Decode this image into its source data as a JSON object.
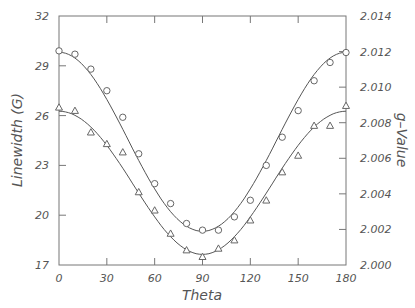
{
  "chart_data": {
    "type": "scatter",
    "title": "",
    "xlabel": "Theta",
    "ylabel": "Linewidth (G)",
    "y2label": "g–Value",
    "xlim": [
      0,
      180
    ],
    "ylim": [
      17,
      32
    ],
    "y2lim": [
      2.0,
      2.014
    ],
    "x_ticks": [
      0,
      30,
      60,
      90,
      120,
      150,
      180
    ],
    "x_tick_labels": [
      "0",
      "30",
      "60",
      "90",
      "120",
      "150",
      "180"
    ],
    "y_ticks": [
      17,
      20,
      23,
      26,
      29,
      32
    ],
    "y_tick_labels": [
      "17",
      "20",
      "23",
      "26",
      "29",
      "32"
    ],
    "y2_ticks": [
      2.0,
      2.002,
      2.004,
      2.006,
      2.008,
      2.01,
      2.012,
      2.014
    ],
    "y2_tick_labels": [
      "2.000",
      "2.002",
      "2.004",
      "2.006",
      "2.008",
      "2.010",
      "2.012",
      "2.014"
    ],
    "grid": false,
    "legend": null,
    "x": [
      0,
      10,
      20,
      30,
      40,
      50,
      60,
      70,
      80,
      90,
      100,
      110,
      120,
      130,
      140,
      150,
      160,
      170,
      180
    ],
    "series": [
      {
        "name": "Linewidth (circles)",
        "marker": "circle",
        "axis": "left",
        "values": [
          29.9,
          29.7,
          28.8,
          27.5,
          25.9,
          23.7,
          21.9,
          20.7,
          19.5,
          19.1,
          19.1,
          19.9,
          20.9,
          23.0,
          24.7,
          26.3,
          28.1,
          29.2,
          29.8
        ]
      },
      {
        "name": "g-Value (triangles)",
        "marker": "triangle",
        "axis": "right",
        "values_left_scale": [
          26.5,
          26.3,
          25.0,
          24.3,
          23.8,
          21.4,
          20.3,
          18.9,
          17.9,
          17.5,
          18.0,
          18.5,
          19.7,
          20.9,
          22.6,
          23.6,
          25.4,
          25.4,
          26.6
        ],
        "values": [
          2.0088,
          2.0087,
          2.0075,
          2.0068,
          2.0064,
          2.0041,
          2.0031,
          2.0018,
          2.0008,
          2.0005,
          2.0009,
          2.0014,
          2.0025,
          2.0036,
          2.0052,
          2.0061,
          2.0078,
          2.0078,
          2.0089
        ]
      }
    ],
    "fit_curves": true
  },
  "style": {
    "line_color": "#555555",
    "marker_color": "#666666",
    "axis_color": "#777777"
  }
}
